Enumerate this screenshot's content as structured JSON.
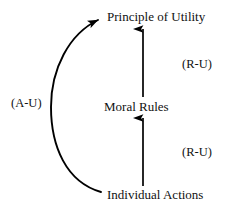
{
  "diagram": {
    "background_color": "#ffffff",
    "stroke_color": "#000000",
    "nodes": [
      {
        "id": "principle-of-utility",
        "label": "Principle of Utility"
      },
      {
        "id": "moral-rules",
        "label": "Moral Rules"
      },
      {
        "id": "individual-actions",
        "label": "Individual Actions"
      }
    ],
    "edge_labels": {
      "act_utilitarian": "(A-U)",
      "rule_utilitarian_upper": "(R-U)",
      "rule_utilitarian_lower": "(R-U)"
    },
    "edges": [
      {
        "id": "individual-actions-to-moral-rules",
        "from": "individual-actions",
        "to": "moral-rules",
        "style": "straight-arrow",
        "label": "(R-U)"
      },
      {
        "id": "moral-rules-to-principle-of-utility",
        "from": "moral-rules",
        "to": "principle-of-utility",
        "style": "straight-arrow",
        "label": "(R-U)"
      },
      {
        "id": "individual-actions-to-principle-of-utility",
        "from": "individual-actions",
        "to": "principle-of-utility",
        "style": "curved-arrow",
        "label": "(A-U)"
      }
    ]
  }
}
